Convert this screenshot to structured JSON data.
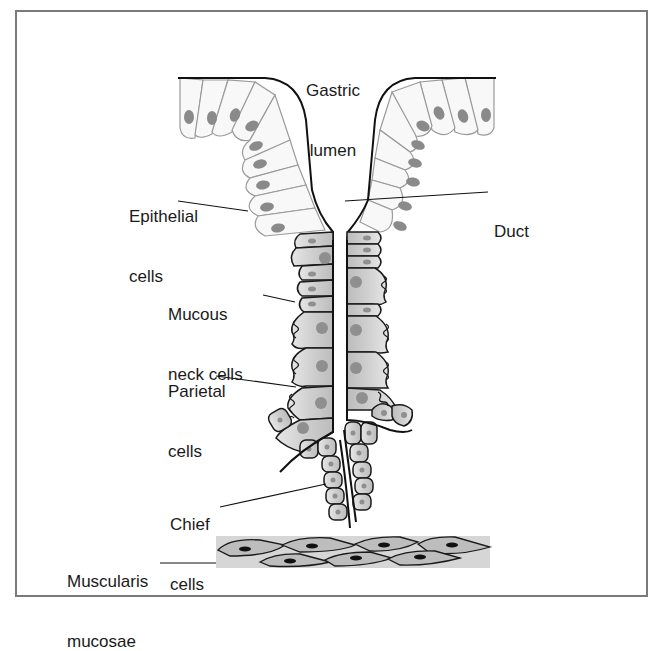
{
  "diagram": {
    "type": "anatomical-illustration",
    "labels": {
      "gastric_lumen": {
        "line1": "Gastric",
        "line2": "lumen"
      },
      "epithelial_cells": {
        "line1": "Epithelial",
        "line2": "cells"
      },
      "duct": {
        "line1": "Duct"
      },
      "mucous_neck_cells": {
        "line1": "Mucous",
        "line2": "neck cells"
      },
      "parietal_cells": {
        "line1": "Parietal",
        "line2": "cells"
      },
      "chief_cells": {
        "line1": "Chief",
        "line2": "cells"
      },
      "muscularis_mucosae": {
        "line1": "Muscularis",
        "line2": "mucosae"
      }
    },
    "colors": {
      "frame": "#7a7a7a",
      "outline": "#1a1a1a",
      "epithelial_fill": "#f7f7f7",
      "nucleus": "#8a8a8a",
      "gland_cell_fill": "#d2d2d2",
      "muscle_band": "#d8d8d8",
      "muscle_cell": "#bdbdbd",
      "muscle_nucleus": "#111111"
    }
  }
}
